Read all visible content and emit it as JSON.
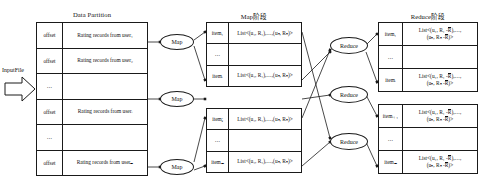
{
  "diagram": {
    "title_input": "InputFile",
    "headers": {
      "data_partition": "Data Partition",
      "map_stage": "Map阶段",
      "reduce_stage": "Reduce阶段"
    },
    "data_partition": {
      "rows": [
        {
          "offset": "offset",
          "record": "Rating records from user₁"
        },
        {
          "offset": "offset",
          "record": "Rating records from user₂"
        },
        {
          "offset": "…",
          "record": ""
        },
        {
          "offset": "offset",
          "record": "Rating records from userᵢ"
        },
        {
          "offset": "…",
          "record": ""
        },
        {
          "offset": "offset",
          "record": "Rating records from userₘ"
        }
      ]
    },
    "map_tables": [
      {
        "rows": [
          {
            "key": "item₁",
            "value": "List<(u₁, R₁),…,(uₙ, Rₙ)>"
          },
          {
            "key": "…",
            "value": ""
          },
          {
            "key": "itemᵢ",
            "value": "List<(u₁, R₁),…,(uₙ, Rₙ)>"
          }
        ]
      },
      {
        "rows": [
          {
            "key": "itemⱼ",
            "value": "List<(u₁, R₁),…,(uₙ, Rₙ)>"
          },
          {
            "key": "…",
            "value": ""
          },
          {
            "key": "itemₘ",
            "value": "List<(u₁, R₁),…,(uₙ, Rₙ)>"
          }
        ]
      }
    ],
    "reduce_tables": [
      {
        "rows": [
          {
            "key": "item₁",
            "line1": "List<(u₁, R₁ -R),…,",
            "line2": "(uₙ, Rₙ -R)>"
          },
          {
            "key": "…",
            "line1": "",
            "line2": ""
          },
          {
            "key": "itemᵢ",
            "line1": "List<(u₁, R₁ -R),…,",
            "line2": "(uₙ, Rₙ -R)>"
          }
        ]
      },
      {
        "rows": [
          {
            "key": "itemᵢ₊₁",
            "line1": "List<(u₁, R₁ -R),…,",
            "line2": "(uₙ, Rₙ -R)>"
          },
          {
            "key": "…",
            "line1": "",
            "line2": ""
          },
          {
            "key": "itemₘ",
            "line1": "List<(u₁, R₁ -R),…,",
            "line2": "(uₙ, Rₙ -R)>"
          }
        ]
      }
    ],
    "map_nodes": [
      {
        "label": "Map"
      },
      {
        "label": "Map"
      },
      {
        "label": "Map"
      }
    ],
    "reduce_nodes": [
      {
        "label": "Reduce"
      },
      {
        "label": "Reduce"
      },
      {
        "label": "Reduce"
      }
    ],
    "colors": {
      "stroke": "#1a1a1a",
      "background": "#ffffff",
      "text": "#111111"
    }
  }
}
